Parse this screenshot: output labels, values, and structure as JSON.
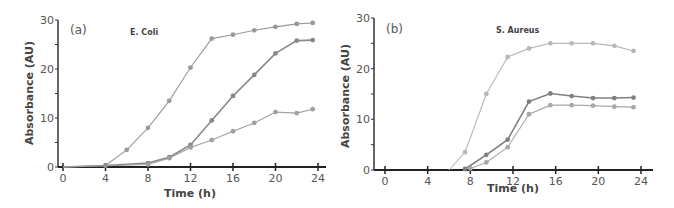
{
  "chart_data": [
    {
      "type": "line",
      "panel_label": "(a)",
      "title": "E. Coli",
      "xlabel": "Time (h)",
      "ylabel": "Absorbance (AU)",
      "xlim": [
        0,
        24
      ],
      "ylim": [
        0,
        30
      ],
      "xticks": [
        "0",
        "4",
        "8",
        "12",
        "16",
        "20",
        "24"
      ],
      "yticks": [
        "0",
        "10",
        "20",
        "30"
      ],
      "grid": false,
      "legend": "none",
      "series": [
        {
          "name": "series-1",
          "color": "#999999",
          "points": [
            [
              0,
              0
            ],
            [
              4,
              0.3
            ],
            [
              6,
              3.5
            ],
            [
              8,
              8
            ],
            [
              10,
              13.5
            ],
            [
              12,
              20.3
            ],
            [
              14,
              26.2
            ],
            [
              16,
              27
            ],
            [
              18,
              27.9
            ],
            [
              20,
              28.6
            ],
            [
              22,
              29.2
            ],
            [
              23.5,
              29.4
            ]
          ]
        },
        {
          "name": "series-2",
          "color": "#888888",
          "points": [
            [
              0,
              0
            ],
            [
              4,
              0.3
            ],
            [
              8,
              0.8
            ],
            [
              10,
              2
            ],
            [
              12,
              4.5
            ],
            [
              14,
              9.5
            ],
            [
              16,
              14.5
            ],
            [
              18,
              18.8
            ],
            [
              20,
              23.2
            ],
            [
              22,
              25.8
            ],
            [
              23.5,
              25.9
            ]
          ]
        },
        {
          "name": "series-3",
          "color": "#a0a0a0",
          "points": [
            [
              0,
              0
            ],
            [
              8,
              0.5
            ],
            [
              10,
              1.8
            ],
            [
              12,
              4
            ],
            [
              14,
              5.5
            ],
            [
              16,
              7.3
            ],
            [
              18,
              9
            ],
            [
              20,
              11.2
            ],
            [
              22,
              11
            ],
            [
              23.5,
              11.8
            ]
          ]
        }
      ]
    },
    {
      "type": "line",
      "panel_label": "(b)",
      "title": "S. Aureus",
      "xlabel": "Time (h)",
      "ylabel": "Absorbance (AU)",
      "xlim": [
        0,
        24
      ],
      "ylim": [
        0,
        30
      ],
      "xticks": [
        "0",
        "4",
        "8",
        "12",
        "16",
        "20",
        "24"
      ],
      "yticks": [
        "0",
        "10",
        "20",
        "30"
      ],
      "grid": false,
      "legend": "none",
      "series": [
        {
          "name": "series-1",
          "color": "#b8b8b8",
          "points": [
            [
              6,
              0
            ],
            [
              7.5,
              3.5
            ],
            [
              9.5,
              15
            ],
            [
              11.5,
              22.3
            ],
            [
              13.5,
              24
            ],
            [
              15.5,
              25
            ],
            [
              17.5,
              25
            ],
            [
              19.5,
              25
            ],
            [
              21.5,
              24.5
            ],
            [
              23.3,
              23.5
            ]
          ]
        },
        {
          "name": "series-2",
          "color": "#808080",
          "points": [
            [
              7.5,
              0.2
            ],
            [
              9.5,
              3
            ],
            [
              11.5,
              6
            ],
            [
              13.5,
              13.5
            ],
            [
              15.5,
              15.1
            ],
            [
              17.5,
              14.6
            ],
            [
              19.5,
              14.2
            ],
            [
              21.5,
              14.2
            ],
            [
              23.3,
              14.3
            ]
          ]
        },
        {
          "name": "series-3",
          "color": "#a8a8a8",
          "points": [
            [
              8,
              0.3
            ],
            [
              9.5,
              1.5
            ],
            [
              11.5,
              4.5
            ],
            [
              13.5,
              11
            ],
            [
              15.5,
              12.8
            ],
            [
              17.5,
              12.8
            ],
            [
              19.5,
              12.7
            ],
            [
              21.5,
              12.5
            ],
            [
              23.3,
              12.4
            ]
          ]
        }
      ]
    }
  ]
}
